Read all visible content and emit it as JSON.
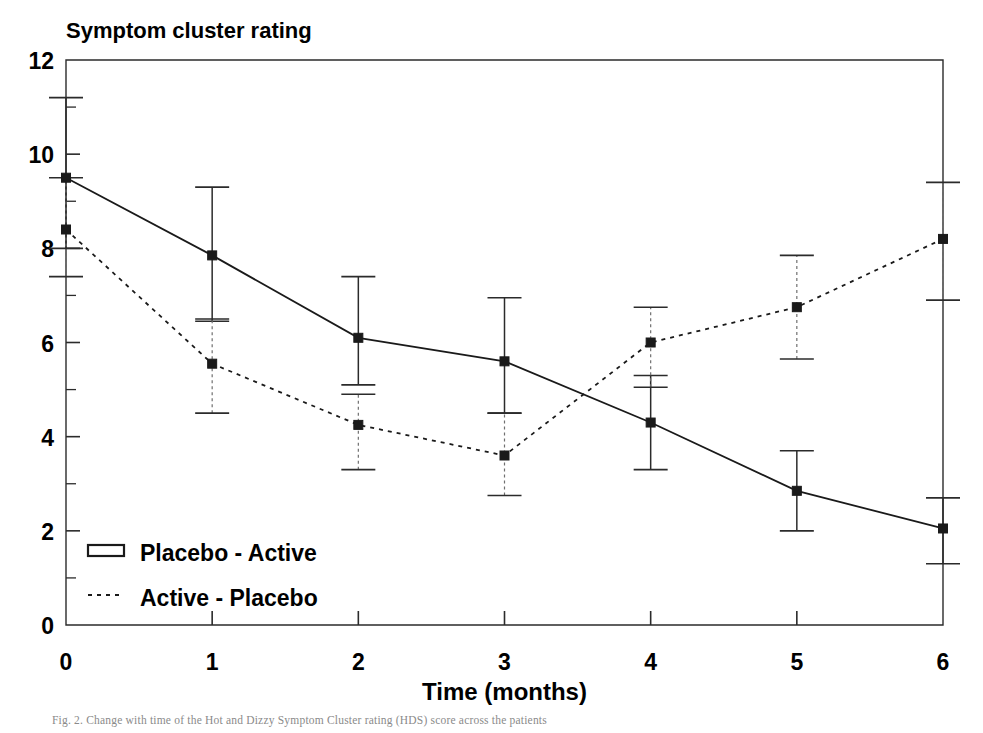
{
  "figure": {
    "title": "Symptom cluster rating",
    "caption": "Fig. 2.   Change with time of the Hot and Dizzy Symptom Cluster rating (HDS) score across the patients"
  },
  "chart_data": {
    "type": "line",
    "title": "Symptom cluster rating",
    "xlabel": "Time (months)",
    "ylabel": "Symptom cluster rating",
    "x": [
      0,
      1,
      2,
      3,
      4,
      5,
      6
    ],
    "xlim": [
      0,
      6
    ],
    "ylim": [
      0,
      12
    ],
    "xticks": [
      "0",
      "1",
      "2",
      "3",
      "4",
      "5",
      "6"
    ],
    "yticks": [
      "0",
      "2",
      "4",
      "6",
      "8",
      "10",
      "12"
    ],
    "grid": false,
    "legend_position": "lower-left-inside",
    "errorbars": true,
    "series": [
      {
        "name": "Placebo - Active",
        "style": "solid",
        "marker": "square",
        "color": "#1a1a1a",
        "values": [
          9.5,
          7.85,
          6.1,
          5.6,
          4.3,
          2.85,
          2.05
        ],
        "err_low": [
          8.0,
          6.45,
          5.1,
          4.5,
          3.3,
          2.0,
          1.3
        ],
        "err_high": [
          11.2,
          9.3,
          7.4,
          6.95,
          5.3,
          3.7,
          2.7
        ]
      },
      {
        "name": "Active - Placebo",
        "style": "dotted",
        "marker": "square",
        "color": "#1a1a1a",
        "values": [
          8.4,
          5.55,
          4.25,
          3.6,
          6.0,
          6.75,
          8.2
        ],
        "err_low": [
          7.4,
          4.5,
          3.3,
          2.75,
          5.05,
          5.65,
          6.9
        ],
        "err_high": [
          9.5,
          6.5,
          4.9,
          4.5,
          6.75,
          7.85,
          9.4
        ]
      }
    ]
  },
  "legend": {
    "items": [
      {
        "label": "Placebo - Active",
        "swatch": "solid-bar"
      },
      {
        "label": "Active - Placebo",
        "swatch": "dotted-line"
      }
    ]
  }
}
